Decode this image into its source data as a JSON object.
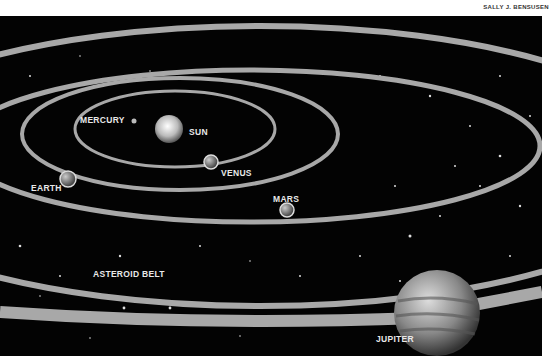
{
  "credit": "SALLY J. BENSUSEN",
  "labels": {
    "mercury": "MERCURY",
    "sun": "SUN",
    "venus": "VENUS",
    "earth": "EARTH",
    "mars": "MARS",
    "asteroid_belt": "ASTEROID BELT",
    "jupiter": "JUPITER"
  },
  "colors": {
    "background": "#030303",
    "orbit": "#a8a8a8",
    "label": "#e8e8e8"
  }
}
